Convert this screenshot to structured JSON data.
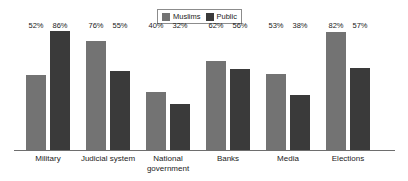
{
  "legend": {
    "entries": [
      {
        "label": "Muslims",
        "color": "#737373",
        "icon": "legend-swatch-icon"
      },
      {
        "label": "Public",
        "color": "#3a3a3a",
        "icon": "legend-swatch-icon"
      }
    ]
  },
  "chart_data": {
    "type": "bar",
    "title": "",
    "subtitle": "",
    "xlabel": "",
    "ylabel": "",
    "ylim": [
      0,
      100
    ],
    "grid": false,
    "legend_position": "top-center",
    "value_suffix": "%",
    "categories": [
      "Military",
      "Judicial system",
      "National\ngovernment",
      "Banks",
      "Media",
      "Elections"
    ],
    "series": [
      {
        "name": "Muslims",
        "color": "#737373",
        "values": [
          52,
          76,
          40,
          62,
          53,
          82
        ],
        "labels": [
          "52%",
          "76%",
          "40%",
          "62%",
          "53%",
          "82%"
        ]
      },
      {
        "name": "Public",
        "color": "#3a3a3a",
        "values": [
          86,
          55,
          32,
          56,
          38,
          57
        ],
        "labels": [
          "86%",
          "55%",
          "32%",
          "56%",
          "38%",
          "57%"
        ]
      }
    ]
  }
}
